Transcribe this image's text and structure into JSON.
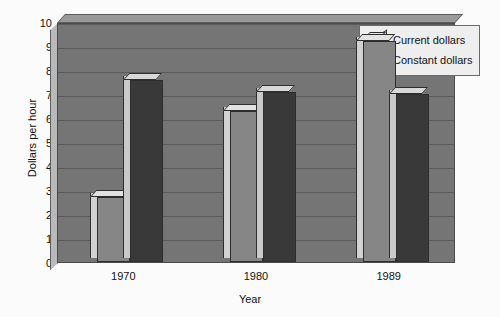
{
  "chart_data": {
    "type": "bar",
    "title": "",
    "xlabel": "Year",
    "ylabel": "Dollars per hour",
    "categories": [
      "1970",
      "1980",
      "1989"
    ],
    "ylim": [
      0,
      10
    ],
    "yticks": [
      0,
      1,
      2,
      3,
      4,
      5,
      6,
      7,
      8,
      9,
      10
    ],
    "ytick_labels": [
      "0",
      "1",
      "2",
      "3",
      "4",
      "5",
      "6",
      "7",
      "8",
      "9",
      "10"
    ],
    "grid": true,
    "legend_position": "top-right",
    "series": [
      {
        "name": "Current dollars",
        "color": "#868686",
        "values": [
          2.7,
          6.3,
          9.2
        ]
      },
      {
        "name": "Constant dollars",
        "color": "#393939",
        "values": [
          7.6,
          7.1,
          7.0
        ]
      }
    ]
  },
  "axis": {
    "ylabel": "Dollars per hour",
    "xlabel": "Year"
  },
  "legend": {
    "items": [
      {
        "label": "Current dollars"
      },
      {
        "label": "Constant dollars"
      }
    ]
  }
}
